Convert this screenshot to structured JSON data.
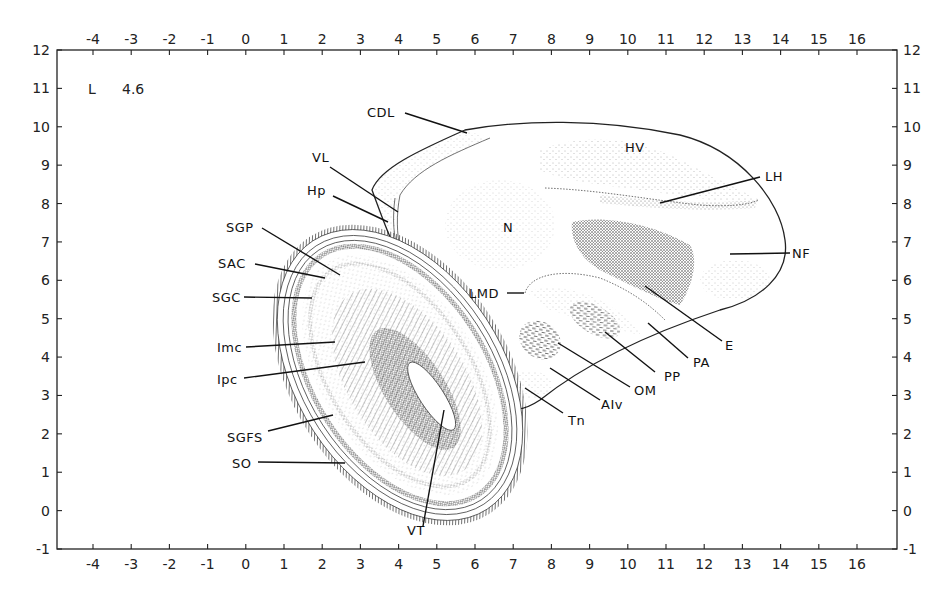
{
  "plate": {
    "section_label": "L",
    "section_value": "4.6",
    "background": "#ffffff",
    "ink_color": "#1a1a1a"
  },
  "axes": {
    "x_ticks": [
      "-4",
      "-3",
      "-2",
      "-1",
      "0",
      "1",
      "2",
      "3",
      "4",
      "5",
      "6",
      "7",
      "8",
      "9",
      "10",
      "11",
      "12",
      "13",
      "14",
      "15",
      "16"
    ],
    "y_ticks": [
      "12",
      "11",
      "10",
      "9",
      "8",
      "7",
      "6",
      "5",
      "4",
      "3",
      "2",
      "1",
      "0",
      "-1"
    ],
    "x_range": [
      -4,
      16
    ],
    "y_range": [
      -1,
      12
    ]
  },
  "labels": {
    "CDL": "CDL",
    "VL": "VL",
    "Hp": "Hp",
    "SGP": "SGP",
    "SAC": "SAC",
    "SGC": "SGC",
    "Imc": "Imc",
    "Ipc": "Ipc",
    "SGFS": "SGFS",
    "SO": "SO",
    "VT": "VT",
    "N": "N",
    "HV": "HV",
    "LH": "LH",
    "NF": "NF",
    "LMD": "LMD",
    "E": "E",
    "PA": "PA",
    "PP": "PP",
    "OM": "OM",
    "AIv": "AIv",
    "Tn": "Tn"
  }
}
